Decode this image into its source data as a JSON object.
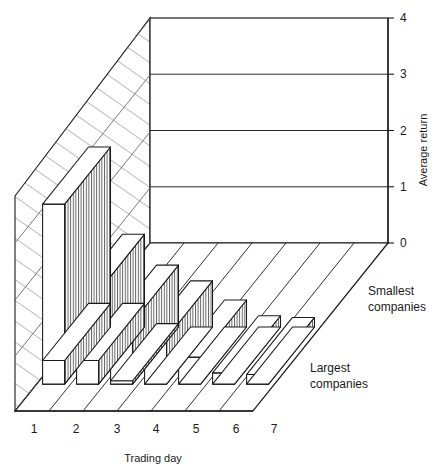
{
  "chart_data": {
    "type": "bar",
    "title": "",
    "subtitle": "",
    "xlabel": "Trading day",
    "ylabel": "Average return",
    "categories": [
      "1",
      "2",
      "3",
      "4",
      "5",
      "6",
      "7"
    ],
    "ylim": [
      0,
      4
    ],
    "yticks": [
      0,
      1,
      2,
      3,
      4
    ],
    "ytick_labels": [
      "0",
      "1",
      "2",
      "3",
      "4"
    ],
    "grid": true,
    "grid_axis": "y",
    "legend_position": "right-inline",
    "projection": "3d-isometric",
    "row_order_front_to_back": [
      "Largest companies",
      "Smallest companies"
    ],
    "series": [
      {
        "name": "Largest companies",
        "values": [
          0.42,
          0.42,
          0.06,
          0.0,
          0.0,
          0.0,
          0.0
        ]
      },
      {
        "name": "Smallest companies",
        "values": [
          3.2,
          1.65,
          1.1,
          0.82,
          0.48,
          0.2,
          0.17
        ]
      }
    ],
    "annotations": [
      "Smallest companies",
      "Largest companies"
    ]
  },
  "axes": {
    "y_title": "Average return",
    "x_title": "Trading day",
    "x_tick_labels": [
      "1",
      "2",
      "3",
      "4",
      "5",
      "6",
      "7"
    ],
    "y_tick_labels": [
      "4",
      "3",
      "2",
      "1",
      "0"
    ]
  },
  "legend": {
    "back_row_label_line1": "Smallest",
    "back_row_label_line2": "companies",
    "front_row_label_line1": "Largest",
    "front_row_label_line2": "companies"
  },
  "colors": {
    "background": "#ffffff",
    "stroke": "#1a1a1a",
    "bar_face": "#ffffff",
    "bar_top": "#ffffff",
    "hatch": "#4a4a4a",
    "gridline": "#2a2a2a",
    "wall_hatch": "#555555"
  }
}
